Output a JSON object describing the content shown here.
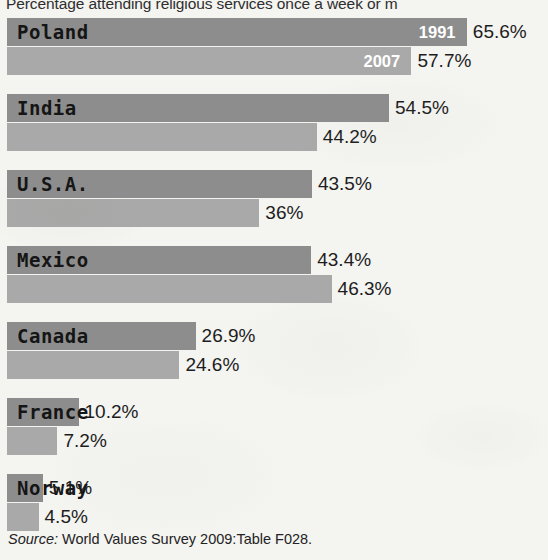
{
  "chart_data": {
    "type": "bar",
    "orientation": "horizontal",
    "title": "Percentage attending religious services once a week or m",
    "xlabel": "",
    "ylabel": "",
    "grid": false,
    "legend_position": "inline-first-bar",
    "categories": [
      "Poland",
      "India",
      "U.S.A.",
      "Mexico",
      "Canada",
      "France",
      "Norway"
    ],
    "series": [
      {
        "name": "1991",
        "color": "#8d8d8d",
        "values": [
          65.6,
          54.5,
          43.5,
          43.4,
          26.9,
          10.2,
          5.1
        ],
        "value_labels": [
          "65.6%",
          "54.5%",
          "43.5%",
          "43.4%",
          "26.9%",
          "10.2%",
          "5.1%"
        ]
      },
      {
        "name": "2007",
        "color": "#a9a9a9",
        "values": [
          57.7,
          44.2,
          36.0,
          46.3,
          24.6,
          7.2,
          4.5
        ],
        "value_labels": [
          "57.7%",
          "44.2%",
          "36%",
          "46.3%",
          "24.6%",
          "7.2%",
          "4.5%"
        ]
      }
    ],
    "xlim": [
      0,
      65.6
    ],
    "source": "World Values Survey 2009:Table F028."
  },
  "title": {
    "text": "Percentage attending religious services once a week or m"
  },
  "legend": {
    "first_year": "1991",
    "second_year": "2007"
  },
  "rows": [
    {
      "country": "Poland",
      "v1991": "65.6%",
      "v2007": "57.7%",
      "n1991": 65.6,
      "n2007": 57.7
    },
    {
      "country": "India",
      "v1991": "54.5%",
      "v2007": "44.2%",
      "n1991": 54.5,
      "n2007": 44.2
    },
    {
      "country": "U.S.A.",
      "v1991": "43.5%",
      "v2007": "36%",
      "n1991": 43.5,
      "n2007": 36.0
    },
    {
      "country": "Mexico",
      "v1991": "43.4%",
      "v2007": "46.3%",
      "n1991": 43.4,
      "n2007": 46.3
    },
    {
      "country": "Canada",
      "v1991": "26.9%",
      "v2007": "24.6%",
      "n1991": 26.9,
      "n2007": 24.6
    },
    {
      "country": "France",
      "v1991": "10.2%",
      "v2007": "7.2%",
      "n1991": 10.2,
      "n2007": 7.2
    },
    {
      "country": "Norway",
      "v1991": "5.1%",
      "v2007": "4.5%",
      "n1991": 5.1,
      "n2007": 4.5
    }
  ],
  "source": {
    "label": "Source:",
    "text": "World Values Survey 2009:Table F028."
  },
  "colors": {
    "bar_1991": "#8d8d8d",
    "bar_2007": "#a9a9a9",
    "background": "#f4f4f1",
    "text": "#1d1d1d"
  }
}
